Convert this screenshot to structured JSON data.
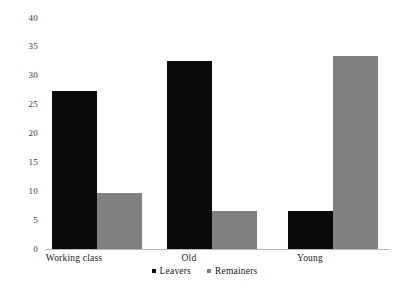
{
  "chart_data": {
    "type": "bar",
    "title": "",
    "xlabel": "",
    "ylabel": "",
    "categories": [
      "Working class",
      "Old",
      "Young"
    ],
    "series": [
      {
        "name": "Leavers",
        "color": "#0a0a0a",
        "values": [
          27.3,
          32.5,
          6.6
        ]
      },
      {
        "name": "Remainers",
        "color": "#808080",
        "values": [
          9.7,
          6.6,
          33.4
        ]
      }
    ],
    "ylim": [
      0,
      40
    ],
    "y_ticks": [
      40,
      35,
      30,
      25,
      20,
      15,
      10,
      5,
      0
    ],
    "grid": false,
    "legend_position": "bottom"
  },
  "legend": {
    "items": [
      {
        "label": "Leavers",
        "marker": "square-marker"
      },
      {
        "label": "Remainers",
        "marker": "square-marker"
      }
    ]
  }
}
